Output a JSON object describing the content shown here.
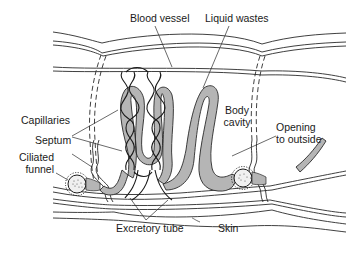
{
  "diagram": {
    "colors": {
      "line": "#2a2a2a",
      "tube_fill": "#b5b5b5",
      "background": "#ffffff",
      "funnel_dots": "#555555"
    },
    "labels": {
      "blood_vessel": "Blood vessel",
      "liquid_wastes": "Liquid wastes",
      "capillaries": "Capillaries",
      "body_cavity_1": "Body",
      "body_cavity_2": "cavity",
      "septum": "Septum",
      "ciliated_funnel_1": "Ciliated",
      "ciliated_funnel_2": "funnel",
      "opening_1": "Opening",
      "opening_2": "to outside",
      "excretory_tube": "Excretory tube",
      "skin": "Skin"
    }
  }
}
